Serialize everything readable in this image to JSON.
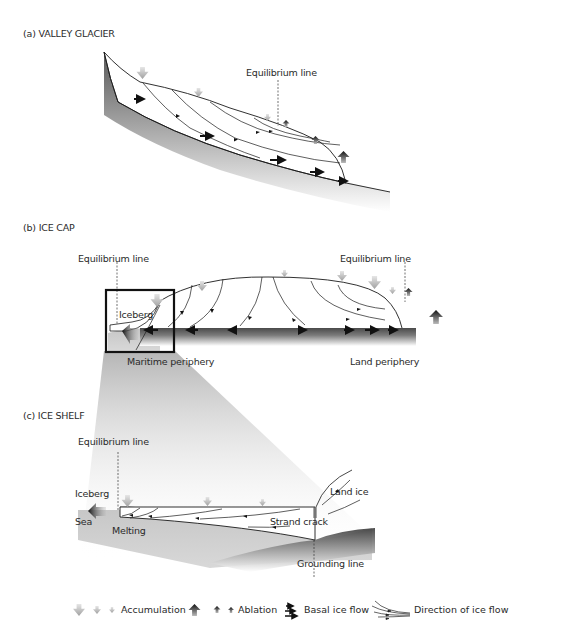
{
  "panels": [
    {
      "id": "a",
      "title": "(a) VALLEY GLACIER",
      "labels": {
        "equilibrium_line": "Equilibrium line"
      }
    },
    {
      "id": "b",
      "title": "(b) ICE CAP",
      "labels": {
        "equilibrium_line_left": "Equilibrium line",
        "equilibrium_line_right": "Equilibrium line",
        "iceberg": "Iceberg",
        "maritime_periphery": "Maritime periphery",
        "land_periphery": "Land periphery"
      }
    },
    {
      "id": "c",
      "title": "(c) ICE SHELF",
      "labels": {
        "equilibrium_line": "Equilibrium line",
        "iceberg": "Iceberg",
        "sea": "Sea",
        "melting": "Melting",
        "land_ice": "Land ice",
        "strand_crack": "Strand crack",
        "grounding_line": "Grounding line"
      }
    }
  ],
  "legend": [
    {
      "icon": "accumulation-arrows-icon",
      "label": "Accumulation"
    },
    {
      "icon": "ablation-arrows-icon",
      "label": "Ablation"
    },
    {
      "icon": "basal-ice-flow-icon",
      "label": "Basal ice flow"
    },
    {
      "icon": "ice-flow-direction-icon",
      "label": "Direction of ice flow"
    }
  ],
  "colors": {
    "ice": "#ffffff",
    "bedrock_dark": "#555555",
    "sea": "#c8c8c8",
    "line": "#1a1a1a",
    "accumulation": "#bdbdbd",
    "ablation": "#333333"
  }
}
